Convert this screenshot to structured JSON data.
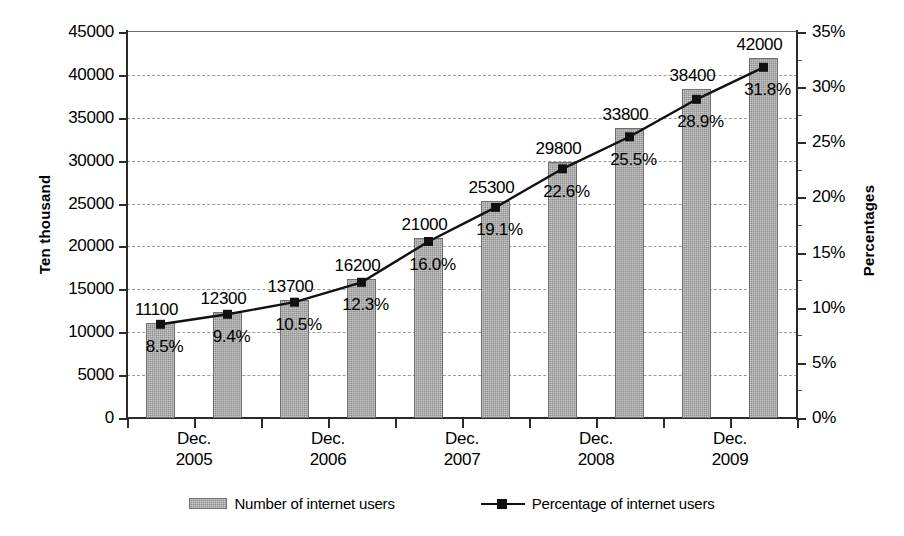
{
  "chart_data": {
    "type": "bar",
    "title": "",
    "categories": [
      "Dec. 2005",
      "",
      "Dec. 2006",
      "",
      "Dec. 2007",
      "",
      "Dec. 2008",
      "",
      "Dec. 2009",
      ""
    ],
    "x_tick_labels": [
      {
        "line1": "Dec.",
        "line2": "2005"
      },
      {
        "line1": "Dec.",
        "line2": "2006"
      },
      {
        "line1": "Dec.",
        "line2": "2007"
      },
      {
        "line1": "Dec.",
        "line2": "2008"
      },
      {
        "line1": "Dec.",
        "line2": "2009"
      }
    ],
    "series": [
      {
        "name": "Number of internet users",
        "type": "bar",
        "axis": "left",
        "values": [
          11100,
          12300,
          13700,
          16200,
          21000,
          25300,
          29800,
          33800,
          38400,
          42000
        ],
        "labels": [
          "11100",
          "12300",
          "13700",
          "16200",
          "21000",
          "25300",
          "29800",
          "33800",
          "38400",
          "42000"
        ],
        "color": "#8f8f8f"
      },
      {
        "name": "Percentage of internet users",
        "type": "line",
        "axis": "right",
        "values": [
          8.5,
          9.4,
          10.5,
          12.3,
          16.0,
          19.1,
          22.6,
          25.5,
          28.9,
          31.8
        ],
        "labels": [
          "8.5%",
          "9.4%",
          "10.5%",
          "12.3%",
          "16.0%",
          "19.1%",
          "22.6%",
          "25.5%",
          "28.9%",
          "31.8%"
        ],
        "color": "#111111"
      }
    ],
    "xlabel": "",
    "ylabel": "Ten thousand",
    "y2label": "Percentages",
    "ylim": [
      0,
      45000
    ],
    "y2lim": [
      0,
      35
    ],
    "y_ticks": [
      0,
      5000,
      10000,
      15000,
      20000,
      25000,
      30000,
      35000,
      40000,
      45000
    ],
    "y_tick_labels": [
      "0",
      "5000",
      "10000",
      "15000",
      "20000",
      "25000",
      "30000",
      "35000",
      "40000",
      "45000"
    ],
    "y2_ticks": [
      0,
      5,
      10,
      15,
      20,
      25,
      30,
      35
    ],
    "y2_tick_labels": [
      "0%",
      "5%",
      "10%",
      "15%",
      "20%",
      "25%",
      "30%",
      "35%"
    ],
    "grid": true,
    "legend_position": "bottom"
  },
  "legend": {
    "items": [
      {
        "label": "Number of internet users",
        "marker": "bar-swatch"
      },
      {
        "label": "Percentage of internet users",
        "marker": "line-square-marker"
      }
    ]
  }
}
